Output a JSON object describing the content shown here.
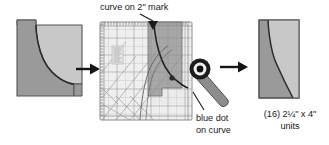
{
  "diagram": {
    "steps": [
      {
        "name": "source-unit",
        "label": "pieced curved unit before trimming"
      },
      {
        "name": "trim-step",
        "label": "ruler aligned on unit, rotary cutter trimming"
      },
      {
        "name": "result-unit",
        "label": "finished trimmed unit"
      }
    ]
  },
  "annotations": {
    "curve_mark": "curve on 2\" mark",
    "blue_dot_line1": "blue dot",
    "blue_dot_line2": "on curve",
    "units_line1": "(16) 2¼\" x 4\"",
    "units_line2": "units"
  },
  "icons": {
    "arrow_left_step": "arrow-right-icon",
    "arrow_right_step": "arrow-right-icon",
    "cutter": "rotary-cutter-icon",
    "marker": "triangle-marker-icon"
  },
  "colors": {
    "fabric_dark": "#9a9a9a",
    "fabric_light": "#c8c8c8",
    "outline": "#4d4d4d",
    "ruler_fill": "#efefef",
    "ruler_grid": "#9a9a9a",
    "ruler_edge": "#b5b5b5",
    "overlay_fabric": "#8f8f8f",
    "cutter_body": "#8d8d8d",
    "cutter_blade_ring": "#1c1c1c",
    "arrow": "#141414",
    "text": "#1a1a1a",
    "leader": "#1a1a1a",
    "background": "#ffffff"
  },
  "measurements": {
    "width_px": 329,
    "height_px": 145
  }
}
